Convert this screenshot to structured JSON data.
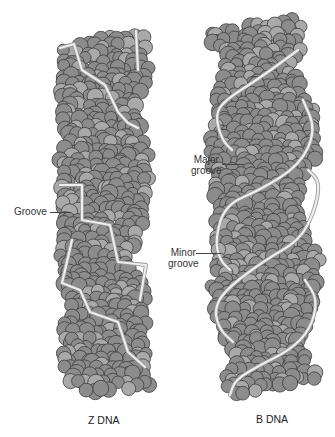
{
  "figure": {
    "atom_fill": "#8c8c8c",
    "atom_fill_light": "#a9a9a9",
    "atom_stroke": "#3c3c3c",
    "backbone_color": "#eeeeee",
    "backbone_edge": "#9a9a9a"
  },
  "z_dna": {
    "caption": "Z DNA",
    "groove_label": "Groove",
    "outline": [
      [
        62,
        48
      ],
      [
        135,
        30
      ],
      [
        152,
        40
      ],
      [
        148,
        78
      ],
      [
        138,
        112
      ],
      [
        150,
        160
      ],
      [
        148,
        212
      ],
      [
        130,
        260
      ],
      [
        150,
        300
      ],
      [
        145,
        340
      ],
      [
        150,
        388
      ],
      [
        80,
        395
      ],
      [
        62,
        370
      ],
      [
        65,
        300
      ],
      [
        55,
        245
      ],
      [
        60,
        190
      ],
      [
        60,
        160
      ],
      [
        62,
        120
      ],
      [
        60,
        80
      ]
    ],
    "backbone_a": [
      [
        60,
        48
      ],
      [
        74,
        44
      ],
      [
        82,
        70
      ],
      [
        105,
        85
      ],
      [
        118,
        112
      ],
      [
        128,
        123
      ],
      [
        138,
        128
      ]
    ],
    "backbone_b": [
      [
        136,
        31
      ],
      [
        138,
        70
      ]
    ],
    "backbone_c": [
      [
        60,
        185
      ],
      [
        82,
        185
      ],
      [
        82,
        220
      ],
      [
        110,
        225
      ],
      [
        118,
        262
      ],
      [
        146,
        265
      ],
      [
        140,
        300
      ]
    ],
    "backbone_d": [
      [
        72,
        240
      ],
      [
        62,
        283
      ],
      [
        80,
        290
      ],
      [
        90,
        312
      ],
      [
        118,
        322
      ],
      [
        128,
        352
      ],
      [
        145,
        367
      ]
    ]
  },
  "b_dna": {
    "caption": "B DNA",
    "major_groove_label": [
      "Major",
      "groove"
    ],
    "minor_groove_label": [
      "Minor",
      "groove"
    ],
    "outline": [
      [
        212,
        30
      ],
      [
        300,
        18
      ],
      [
        308,
        40
      ],
      [
        295,
        75
      ],
      [
        315,
        110
      ],
      [
        315,
        160
      ],
      [
        300,
        200
      ],
      [
        320,
        260
      ],
      [
        320,
        310
      ],
      [
        300,
        340
      ],
      [
        322,
        380
      ],
      [
        240,
        395
      ],
      [
        225,
        390
      ],
      [
        230,
        350
      ],
      [
        210,
        300
      ],
      [
        215,
        230
      ],
      [
        210,
        160
      ],
      [
        210,
        110
      ],
      [
        225,
        70
      ],
      [
        210,
        40
      ]
    ],
    "backbone_a": [
      [
        298,
        50
      ],
      [
        260,
        78
      ],
      [
        225,
        100
      ],
      [
        215,
        115
      ],
      [
        222,
        140
      ],
      [
        232,
        150
      ]
    ],
    "backbone_b": [
      [
        303,
        100
      ],
      [
        316,
        130
      ],
      [
        300,
        165
      ],
      [
        260,
        190
      ],
      [
        225,
        205
      ],
      [
        215,
        240
      ],
      [
        220,
        260
      ],
      [
        230,
        270
      ]
    ],
    "backbone_c": [
      [
        308,
        170
      ],
      [
        320,
        182
      ],
      [
        315,
        210
      ],
      [
        300,
        240
      ],
      [
        265,
        260
      ],
      [
        225,
        290
      ],
      [
        214,
        310
      ],
      [
        220,
        330
      ],
      [
        233,
        342
      ]
    ],
    "backbone_d": [
      [
        305,
        280
      ],
      [
        318,
        300
      ],
      [
        310,
        330
      ],
      [
        290,
        350
      ],
      [
        260,
        365
      ],
      [
        235,
        380
      ],
      [
        230,
        395
      ]
    ]
  }
}
